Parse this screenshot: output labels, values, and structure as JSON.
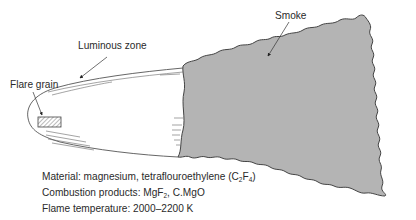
{
  "labels": {
    "flare_grain": "Flare grain",
    "luminous_zone": "Luminous zone",
    "smoke": "Smoke"
  },
  "notes": {
    "material_prefix": "Material: magnesium, tetraflouroethylene (C",
    "material_sub1": "2",
    "material_mid": "F",
    "material_sub2": "4",
    "material_suffix": ")",
    "products_prefix": "Combustion products: MgF",
    "products_sub": "2",
    "products_suffix": ", C.MgO",
    "temperature": "Flame temperature: 2000–2200 K"
  },
  "colors": {
    "smoke_fill": "#b4b4b4",
    "outline": "#444444",
    "background": "#ffffff"
  }
}
